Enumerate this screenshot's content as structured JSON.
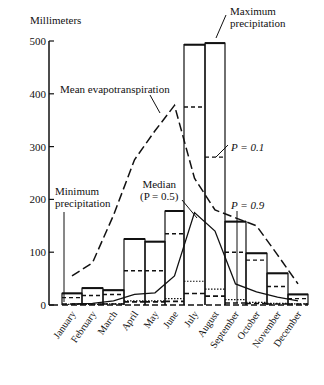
{
  "chart_data": {
    "type": "bar",
    "title": "",
    "ylabel": "Millimeters",
    "xlabel": "",
    "ylim": [
      0,
      500
    ],
    "yticks": [
      0,
      100,
      200,
      300,
      400,
      500
    ],
    "grid": false,
    "categories": [
      "January",
      "February",
      "March",
      "April",
      "May",
      "June",
      "July",
      "August",
      "September",
      "October",
      "November",
      "December"
    ],
    "series": [
      {
        "name": "Maximum precipitation",
        "style": "box top (solid)",
        "values": [
          22,
          32,
          28,
          125,
          120,
          178,
          493,
          496,
          158,
          98,
          60,
          20
        ]
      },
      {
        "name": "P = 0.1",
        "style": "dashed",
        "values": [
          14,
          18,
          20,
          65,
          65,
          135,
          375,
          280,
          100,
          85,
          35,
          12
        ]
      },
      {
        "name": "Median (P = 0.5)",
        "style": "solid line",
        "values": [
          2,
          3,
          8,
          20,
          23,
          55,
          175,
          140,
          40,
          25,
          15,
          8
        ]
      },
      {
        "name": "P = 0.9",
        "style": "dotted",
        "values": [
          1,
          1,
          2,
          8,
          8,
          12,
          45,
          30,
          10,
          5,
          3,
          2
        ]
      },
      {
        "name": "Minimum precipitation",
        "style": "dashed bottom",
        "values": [
          0,
          0,
          0,
          4,
          4,
          5,
          20,
          15,
          2,
          1,
          0,
          0
        ]
      },
      {
        "name": "Mean evapotranspiration",
        "style": "long-dashed line",
        "values": [
          55,
          80,
          170,
          275,
          330,
          378,
          240,
          180,
          165,
          150,
          95,
          40
        ]
      }
    ],
    "annotations": [
      "Maximum precipitation",
      "Mean evapotranspiration",
      "P = 0.1",
      "Median (P = 0.5)",
      "P = 0.9",
      "Minimum precipitation"
    ]
  },
  "labels": {
    "ylabel": "Millimeters",
    "max": [
      "Maximum",
      "precipitation"
    ],
    "evap": "Mean evapotranspiration",
    "p01": "P = 0.1",
    "median": [
      "Median",
      "(P = 0.5)"
    ],
    "p09": "P = 0.9",
    "min": [
      "Minimum",
      "precipitation"
    ]
  }
}
